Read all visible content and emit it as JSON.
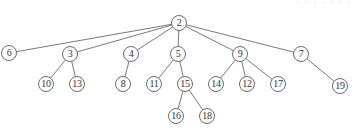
{
  "diagram": {
    "type": "tree",
    "root": "2",
    "top_fragment_text": ". . . . . . .",
    "nodes": [
      {
        "id": "2",
        "label": "2",
        "x": 179,
        "y": 23
      },
      {
        "id": "6",
        "label": "6",
        "x": 9,
        "y": 53
      },
      {
        "id": "3",
        "label": "3",
        "x": 70,
        "y": 54
      },
      {
        "id": "4",
        "label": "4",
        "x": 131,
        "y": 54
      },
      {
        "id": "5",
        "label": "5",
        "x": 178,
        "y": 54
      },
      {
        "id": "9",
        "label": "9",
        "x": 240,
        "y": 54
      },
      {
        "id": "7",
        "label": "7",
        "x": 301,
        "y": 54
      },
      {
        "id": "10",
        "label": "10",
        "x": 46,
        "y": 84
      },
      {
        "id": "13",
        "label": "13",
        "x": 77,
        "y": 84
      },
      {
        "id": "8",
        "label": "8",
        "x": 123,
        "y": 84
      },
      {
        "id": "11",
        "label": "11",
        "x": 154,
        "y": 84
      },
      {
        "id": "15",
        "label": "15",
        "x": 185,
        "y": 84
      },
      {
        "id": "14",
        "label": "14",
        "x": 216,
        "y": 84
      },
      {
        "id": "12",
        "label": "12",
        "x": 247,
        "y": 84
      },
      {
        "id": "17",
        "label": "17",
        "x": 278,
        "y": 84
      },
      {
        "id": "19",
        "label": "19",
        "x": 340,
        "y": 86
      },
      {
        "id": "16",
        "label": "16",
        "x": 176,
        "y": 116
      },
      {
        "id": "18",
        "label": "18",
        "x": 207,
        "y": 116
      }
    ],
    "edges": [
      [
        "2",
        "6"
      ],
      [
        "2",
        "3"
      ],
      [
        "2",
        "4"
      ],
      [
        "2",
        "5"
      ],
      [
        "2",
        "9"
      ],
      [
        "2",
        "7"
      ],
      [
        "3",
        "10"
      ],
      [
        "3",
        "13"
      ],
      [
        "4",
        "8"
      ],
      [
        "5",
        "11"
      ],
      [
        "5",
        "15"
      ],
      [
        "15",
        "16"
      ],
      [
        "15",
        "18"
      ],
      [
        "9",
        "14"
      ],
      [
        "9",
        "12"
      ],
      [
        "9",
        "17"
      ],
      [
        "7",
        "19"
      ]
    ],
    "style": {
      "node_radius": 7.5,
      "edge_color": "#6a6a6a",
      "node_stroke": "#5a5a5a",
      "node_fill": "#ffffff",
      "label_color": "#333333",
      "background": "#ffffff"
    }
  }
}
